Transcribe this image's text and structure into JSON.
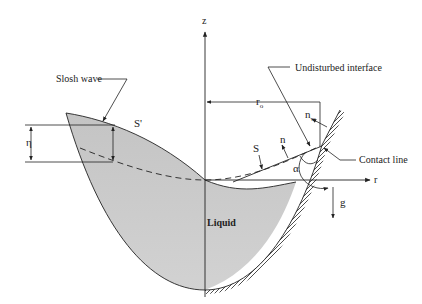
{
  "figure": {
    "type": "schematic",
    "colors": {
      "liquid_fill": "#c9c9c9",
      "line": "#222222",
      "background": "#ffffff"
    }
  },
  "labels": {
    "slosh_wave": "Slosh wave",
    "undisturbed_interface": "Undisturbed interface",
    "contact_line": "Contact line",
    "liquid": "Liquid",
    "s_prime": "S'",
    "s": "S",
    "n": "n",
    "n_w_base": "n",
    "n_w_sub": "w",
    "r_o_base": "r",
    "r_o_sub": "o",
    "alpha": "α",
    "eta": "η",
    "z_axis": "z",
    "r_axis": "r",
    "gravity": "g"
  }
}
